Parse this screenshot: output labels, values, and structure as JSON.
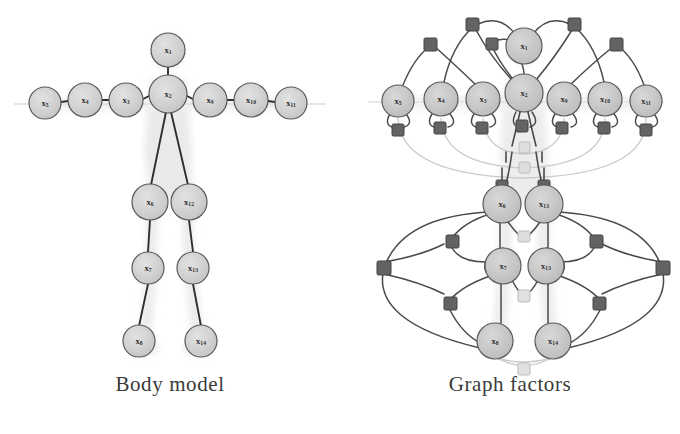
{
  "figure": {
    "background_color": "#ffffff",
    "ink_color": "#3f3f3f",
    "node_fill": "#cfcfcf",
    "node_stroke": "#5a5a5a",
    "factor_dark_color": "#5f5f5f",
    "factor_light_color": "#d8d8d8",
    "silhouette_color": "#dcdcdc",
    "faint_edge_color": "#c8c8c8"
  },
  "panels": [
    {
      "id": "body-model",
      "caption": "Body model",
      "node_count": 14,
      "nodes": [
        {
          "id": "x1",
          "label": "x",
          "sub": "1",
          "cx": 168,
          "cy": 50,
          "r": 17,
          "name": "head"
        },
        {
          "id": "x2",
          "label": "x",
          "sub": "2",
          "cx": 168,
          "cy": 94,
          "r": 19,
          "name": "neck-torso"
        },
        {
          "id": "x3",
          "label": "x",
          "sub": "3",
          "cx": 126,
          "cy": 100,
          "r": 17,
          "name": "left-shoulder"
        },
        {
          "id": "x4",
          "label": "x",
          "sub": "4",
          "cx": 85,
          "cy": 100,
          "r": 17,
          "name": "left-elbow"
        },
        {
          "id": "x5",
          "label": "x",
          "sub": "5",
          "cx": 45,
          "cy": 103,
          "r": 16,
          "name": "left-hand"
        },
        {
          "id": "x9",
          "label": "x",
          "sub": "9",
          "cx": 210,
          "cy": 100,
          "r": 17,
          "name": "right-shoulder"
        },
        {
          "id": "x10",
          "label": "x",
          "sub": "10",
          "cx": 251,
          "cy": 100,
          "r": 17,
          "name": "right-elbow"
        },
        {
          "id": "x11",
          "label": "x",
          "sub": "11",
          "cx": 291,
          "cy": 103,
          "r": 16,
          "name": "right-hand"
        },
        {
          "id": "x6",
          "label": "x",
          "sub": "6",
          "cx": 150,
          "cy": 202,
          "r": 18,
          "name": "left-hip"
        },
        {
          "id": "x7",
          "label": "x",
          "sub": "7",
          "cx": 148,
          "cy": 268,
          "r": 16,
          "name": "left-knee"
        },
        {
          "id": "x8",
          "label": "x",
          "sub": "8",
          "cx": 139,
          "cy": 341,
          "r": 16,
          "name": "left-foot"
        },
        {
          "id": "x12",
          "label": "x",
          "sub": "12",
          "cx": 189,
          "cy": 202,
          "r": 18,
          "name": "right-hip"
        },
        {
          "id": "x13",
          "label": "x",
          "sub": "13",
          "cx": 193,
          "cy": 268,
          "r": 16,
          "name": "right-knee"
        },
        {
          "id": "x14",
          "label": "x",
          "sub": "14",
          "cx": 201,
          "cy": 341,
          "r": 16,
          "name": "right-foot"
        }
      ],
      "edges": [
        {
          "from": "x1",
          "to": "x2"
        },
        {
          "from": "x2",
          "to": "x3"
        },
        {
          "from": "x3",
          "to": "x4"
        },
        {
          "from": "x4",
          "to": "x5"
        },
        {
          "from": "x2",
          "to": "x9"
        },
        {
          "from": "x9",
          "to": "x10"
        },
        {
          "from": "x10",
          "to": "x11"
        },
        {
          "from": "x2",
          "to": "x6"
        },
        {
          "from": "x6",
          "to": "x7"
        },
        {
          "from": "x7",
          "to": "x8"
        },
        {
          "from": "x2",
          "to": "x12"
        },
        {
          "from": "x12",
          "to": "x13"
        },
        {
          "from": "x13",
          "to": "x14"
        }
      ]
    },
    {
      "id": "graph-factors",
      "caption": "Graph factors",
      "node_count": 14,
      "factor_count_dark": 20,
      "factor_count_light": 5,
      "nodes": [
        {
          "id": "x1",
          "label": "x",
          "sub": "1",
          "cx": 184,
          "cy": 46,
          "r": 18,
          "name": "head"
        },
        {
          "id": "x2",
          "label": "x",
          "sub": "2",
          "cx": 184,
          "cy": 93,
          "r": 19,
          "name": "neck-torso"
        },
        {
          "id": "x3",
          "label": "x",
          "sub": "3",
          "cx": 143,
          "cy": 99,
          "r": 17,
          "name": "left-shoulder"
        },
        {
          "id": "x4",
          "label": "x",
          "sub": "4",
          "cx": 101,
          "cy": 99,
          "r": 17,
          "name": "left-elbow"
        },
        {
          "id": "x5",
          "label": "x",
          "sub": "5",
          "cx": 58,
          "cy": 101,
          "r": 16,
          "name": "left-hand"
        },
        {
          "id": "x9",
          "label": "x",
          "sub": "9",
          "cx": 224,
          "cy": 99,
          "r": 17,
          "name": "right-shoulder"
        },
        {
          "id": "x10",
          "label": "x",
          "sub": "10",
          "cx": 265,
          "cy": 99,
          "r": 17,
          "name": "right-elbow"
        },
        {
          "id": "x11",
          "label": "x",
          "sub": "11",
          "cx": 306,
          "cy": 101,
          "r": 16,
          "name": "right-hand"
        },
        {
          "id": "x6",
          "label": "x",
          "sub": "6",
          "cx": 162,
          "cy": 204,
          "r": 19,
          "name": "left-hip"
        },
        {
          "id": "x7",
          "label": "x",
          "sub": "7",
          "cx": 163,
          "cy": 266,
          "r": 18,
          "name": "left-knee"
        },
        {
          "id": "x8",
          "label": "x",
          "sub": "8",
          "cx": 155,
          "cy": 341,
          "r": 18,
          "name": "left-foot"
        },
        {
          "id": "x12",
          "label": "x",
          "sub": "13",
          "cx": 204,
          "cy": 204,
          "r": 19,
          "name": "right-hip"
        },
        {
          "id": "x13",
          "label": "x",
          "sub": "13",
          "cx": 206,
          "cy": 266,
          "r": 18,
          "name": "right-knee"
        },
        {
          "id": "x14",
          "label": "x",
          "sub": "14",
          "cx": 213,
          "cy": 341,
          "r": 18,
          "name": "right-foot"
        }
      ]
    }
  ]
}
